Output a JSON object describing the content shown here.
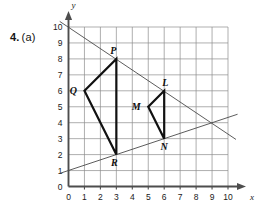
{
  "problem": {
    "number": "4.",
    "part": "(a)"
  },
  "axes": {
    "x_label": "x",
    "y_label": "y",
    "x_ticks": [
      "0",
      "1",
      "2",
      "3",
      "4",
      "5",
      "6",
      "7",
      "8",
      "9",
      "10"
    ],
    "y_ticks": [
      "0",
      "1",
      "2",
      "3",
      "4",
      "5",
      "6",
      "7",
      "8",
      "9",
      "10"
    ],
    "origin_label": "0"
  },
  "chart_data": {
    "type": "scatter",
    "title": "",
    "xlabel": "x",
    "ylabel": "y",
    "xlim": [
      0,
      10
    ],
    "ylim": [
      0,
      10
    ],
    "grid": true,
    "legend": "none",
    "points": [
      {
        "name": "Q",
        "x": 1,
        "y": 6,
        "label_dx": -11,
        "label_dy": 3
      },
      {
        "name": "P",
        "x": 3,
        "y": 8,
        "label_dx": -3,
        "label_dy": -5
      },
      {
        "name": "R",
        "x": 3,
        "y": 2,
        "label_dx": -2,
        "label_dy": 11
      },
      {
        "name": "L",
        "x": 6,
        "y": 6,
        "label_dx": 1,
        "label_dy": -5
      },
      {
        "name": "M",
        "x": 5,
        "y": 5,
        "label_dx": -12,
        "label_dy": 3
      },
      {
        "name": "N",
        "x": 6,
        "y": 3,
        "label_dx": 0,
        "label_dy": 11
      }
    ],
    "shapes": [
      {
        "name": "triangle-QPR",
        "vertices": [
          [
            1,
            6
          ],
          [
            3,
            8
          ],
          [
            3,
            2
          ]
        ],
        "closed": true,
        "stroke": "#111111",
        "stroke_width": 2.2
      },
      {
        "name": "triangle-LMN",
        "vertices": [
          [
            6,
            6
          ],
          [
            5,
            5
          ],
          [
            6,
            3
          ]
        ],
        "closed": true,
        "stroke": "#111111",
        "stroke_width": 2.2
      }
    ],
    "lines": [
      {
        "name": "line-through-P-L",
        "from": [
          -0.55,
          10.35
        ],
        "to": [
          10.5,
          2.95
        ],
        "slope": -0.6667,
        "intercept": 10,
        "stroke": "#4a4a4a",
        "stroke_width": 0.9
      },
      {
        "name": "line-through-R-N",
        "from": [
          -0.55,
          0.82
        ],
        "to": [
          10.6,
          4.53
        ],
        "slope": 0.3333,
        "intercept": 1,
        "stroke": "#4a4a4a",
        "stroke_width": 0.9
      }
    ],
    "colors": {
      "grid": "#8c8c8c",
      "axis": "#4d4d4d",
      "shape_stroke": "#111111",
      "line_stroke": "#4a4a4a",
      "background": "#ffffff"
    }
  }
}
